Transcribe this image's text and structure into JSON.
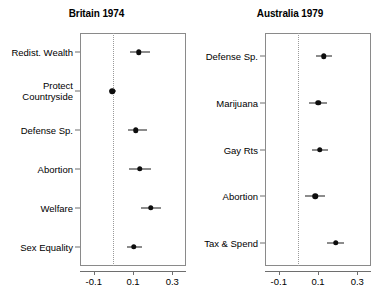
{
  "figure": {
    "background_color": "#ffffff",
    "point_color": "#0d0d0d",
    "axis_color": "#6e6e6e",
    "zero_line_color": "#9a9a9a"
  },
  "chart_data": {
    "type": "scatter",
    "subtype": "dot-whisker-coefficient-plot",
    "title": "",
    "xlabel": "",
    "ylabel": "",
    "xlim": [
      -0.17,
      0.37
    ],
    "xticks": [
      -0.1,
      0.1,
      0.3
    ],
    "xticklabels": [
      "-0.1",
      "0.1",
      "0.3"
    ],
    "grid": false,
    "legend": null,
    "zero_reference_line": 0,
    "panels": [
      {
        "title": "Britain 1974",
        "categories": [
          "Redist. Wealth",
          "Protect\nCountryside",
          "Defense Sp.",
          "Abortion",
          "Welfare",
          "Sex Equality"
        ],
        "points": [
          {
            "label": "Redist. Wealth",
            "estimate": 0.13,
            "ci_low": 0.085,
            "ci_high": 0.185
          },
          {
            "label": "Protect Countryside",
            "estimate": -0.005,
            "ci_low": -0.022,
            "ci_high": 0.012
          },
          {
            "label": "Defense Sp.",
            "estimate": 0.115,
            "ci_low": 0.072,
            "ci_high": 0.17
          },
          {
            "label": "Abortion",
            "estimate": 0.135,
            "ci_low": 0.082,
            "ci_high": 0.193
          },
          {
            "label": "Welfare",
            "estimate": 0.19,
            "ci_low": 0.142,
            "ci_high": 0.243
          },
          {
            "label": "Sex Equality",
            "estimate": 0.105,
            "ci_low": 0.07,
            "ci_high": 0.145
          }
        ]
      },
      {
        "title": "Australia 1979",
        "categories": [
          "Defense Sp.",
          "Marijuana",
          "Gay Rts",
          "Abortion",
          "Tax & Spend"
        ],
        "points": [
          {
            "label": "Defense Sp.",
            "estimate": 0.13,
            "ci_low": 0.092,
            "ci_high": 0.172
          },
          {
            "label": "Marijuana",
            "estimate": 0.1,
            "ci_low": 0.052,
            "ci_high": 0.148
          },
          {
            "label": "Gay Rts",
            "estimate": 0.108,
            "ci_low": 0.068,
            "ci_high": 0.152
          },
          {
            "label": "Abortion",
            "estimate": 0.085,
            "ci_low": 0.035,
            "ci_high": 0.135
          },
          {
            "label": "Tax & Spend",
            "estimate": 0.19,
            "ci_low": 0.148,
            "ci_high": 0.235
          }
        ]
      }
    ]
  }
}
